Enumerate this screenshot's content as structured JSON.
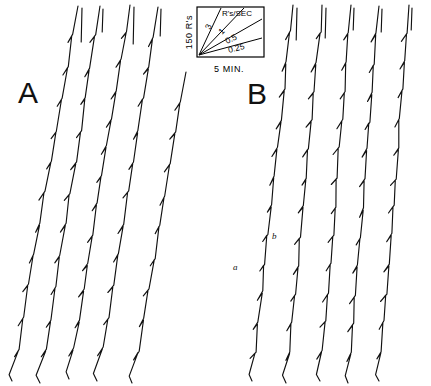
{
  "figure": {
    "background_color": "#ffffff",
    "ink_color": "#111111",
    "width": 431,
    "height": 386
  },
  "panels": [
    {
      "id": "A",
      "label": "A",
      "label_x": 18,
      "label_y": 103,
      "trace_count": 5,
      "traces": [
        {
          "name": "a-trace-1",
          "bottom_x": 12,
          "bottom_y": 381,
          "top_x": 78,
          "top_y": 6,
          "spikes": 11,
          "reset_x": 82,
          "reset_y_top": 8,
          "reset_y_bottom": 42
        },
        {
          "name": "a-trace-2",
          "bottom_x": 40,
          "bottom_y": 383,
          "top_x": 100,
          "top_y": 6,
          "spikes": 11,
          "reset_x": 103,
          "reset_y_top": 9,
          "reset_y_bottom": 32
        },
        {
          "name": "a-trace-3",
          "bottom_x": 69,
          "bottom_y": 379,
          "top_x": 130,
          "top_y": 5,
          "spikes": 12,
          "reset_x": 134,
          "reset_y_top": 7,
          "reset_y_bottom": 44
        },
        {
          "name": "a-trace-4",
          "bottom_x": 97,
          "bottom_y": 381,
          "top_x": 158,
          "top_y": 7,
          "spikes": 11,
          "reset_x": 161,
          "reset_y_top": 9,
          "reset_y_bottom": 36
        },
        {
          "name": "a-trace-5",
          "bottom_x": 132,
          "bottom_y": 383,
          "top_x": 186,
          "top_y": 72,
          "spikes": 9,
          "reset_x": 0,
          "reset_y_top": 0,
          "reset_y_bottom": 0
        }
      ]
    },
    {
      "id": "B",
      "label": "B",
      "label_x": 247,
      "label_y": 104,
      "trace_count": 5,
      "traces": [
        {
          "name": "b-trace-1",
          "bottom_x": 252,
          "bottom_y": 381,
          "top_x": 293,
          "top_y": 5,
          "spikes": 12,
          "reset_x": 297,
          "reset_y_top": 8,
          "reset_y_bottom": 40
        },
        {
          "name": "b-trace-2",
          "bottom_x": 286,
          "bottom_y": 383,
          "top_x": 322,
          "top_y": 5,
          "spikes": 12,
          "reset_x": 326,
          "reset_y_top": 8,
          "reset_y_bottom": 38
        },
        {
          "name": "b-trace-3",
          "bottom_x": 320,
          "bottom_y": 381,
          "top_x": 351,
          "top_y": 5,
          "spikes": 12,
          "reset_x": 354,
          "reset_y_top": 8,
          "reset_y_bottom": 30
        },
        {
          "name": "b-trace-4",
          "bottom_x": 348,
          "bottom_y": 383,
          "top_x": 379,
          "top_y": 6,
          "spikes": 12,
          "reset_x": 382,
          "reset_y_top": 9,
          "reset_y_bottom": 32
        },
        {
          "name": "b-trace-5",
          "bottom_x": 379,
          "bottom_y": 381,
          "top_x": 409,
          "top_y": 5,
          "spikes": 12,
          "reset_x": 412,
          "reset_y_top": 8,
          "reset_y_bottom": 30
        }
      ],
      "trace_tags": [
        {
          "label": "a",
          "x": 233,
          "y": 270
        },
        {
          "label": "b",
          "x": 272,
          "y": 239
        }
      ]
    }
  ],
  "inset": {
    "name": "calibration-inset",
    "box": {
      "x": 197,
      "y": 7,
      "width": 67,
      "height": 50
    },
    "y_axis_label": "150 R's",
    "rate_units_label": "R's/SEC",
    "x_axis_label": "5 MIN.",
    "rays": [
      {
        "label": "3",
        "value": 3,
        "label_x": 210,
        "label_y": 30,
        "label_rotation": -66,
        "end_x": 221,
        "end_y": 8
      },
      {
        "label": "1",
        "value": 1,
        "label_x": 222,
        "label_y": 35,
        "label_rotation": -46,
        "end_x": 244,
        "end_y": 8
      },
      {
        "label": "0.5",
        "value": 0.5,
        "label_x": 227,
        "label_y": 44,
        "label_rotation": -26,
        "end_x": 262,
        "end_y": 19
      },
      {
        "label": "0.25",
        "value": 0.25,
        "label_x": 229,
        "label_y": 53,
        "label_rotation": -15,
        "end_x": 262,
        "end_y": 38
      }
    ]
  },
  "chart_data": {
    "type": "line",
    "title": "",
    "subtitle": "",
    "xlabel": "5 MIN.",
    "ylabel": "150 R's",
    "grid": false,
    "legend": "none",
    "description_axes": {
      "x_calibration": "5 MIN.",
      "y_calibration": "150 R's",
      "rate_units": "R's/SEC"
    },
    "rate_reference_lines": [
      3,
      1,
      0.5,
      0.25
    ],
    "series": [
      {
        "name": "A-1",
        "panel": "A",
        "x": [
          12,
          78
        ],
        "y": [
          381,
          6
        ],
        "event_marks": 11
      },
      {
        "name": "A-2",
        "panel": "A",
        "x": [
          40,
          100
        ],
        "y": [
          383,
          6
        ],
        "event_marks": 11
      },
      {
        "name": "A-3",
        "panel": "A",
        "x": [
          69,
          130
        ],
        "y": [
          379,
          5
        ],
        "event_marks": 12
      },
      {
        "name": "A-4",
        "panel": "A",
        "x": [
          97,
          158
        ],
        "y": [
          381,
          7
        ],
        "event_marks": 11
      },
      {
        "name": "A-5",
        "panel": "A",
        "x": [
          132,
          186
        ],
        "y": [
          383,
          72
        ],
        "event_marks": 9
      },
      {
        "name": "B-1",
        "panel": "B",
        "x": [
          252,
          293
        ],
        "y": [
          381,
          5
        ],
        "event_marks": 12
      },
      {
        "name": "B-2",
        "panel": "B",
        "x": [
          286,
          322
        ],
        "y": [
          383,
          5
        ],
        "event_marks": 12
      },
      {
        "name": "B-3",
        "panel": "B",
        "x": [
          320,
          351
        ],
        "y": [
          381,
          5
        ],
        "event_marks": 12
      },
      {
        "name": "B-4",
        "panel": "B",
        "x": [
          348,
          379
        ],
        "y": [
          383,
          6
        ],
        "event_marks": 12
      },
      {
        "name": "B-5",
        "panel": "B",
        "x": [
          379,
          409
        ],
        "y": [
          381,
          5
        ],
        "event_marks": 12
      }
    ],
    "annotations": [
      {
        "text": "A",
        "x": 18,
        "y": 103
      },
      {
        "text": "B",
        "x": 247,
        "y": 104
      },
      {
        "text": "a",
        "x": 233,
        "y": 270
      },
      {
        "text": "b",
        "x": 272,
        "y": 239
      }
    ]
  }
}
